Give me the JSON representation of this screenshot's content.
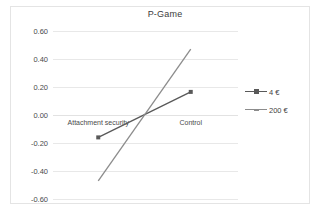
{
  "chart_data": {
    "type": "line",
    "title": "P-Game",
    "xlabel": "",
    "ylabel": "",
    "categories": [
      "Attachment security",
      "Control"
    ],
    "ylim": [
      -0.6,
      0.6
    ],
    "yticks": [
      "0.60",
      "0.40",
      "0.20",
      "0.00",
      "-0.20",
      "-0.40",
      "-0.60"
    ],
    "ytick_values": [
      0.6,
      0.4,
      0.2,
      0.0,
      -0.2,
      -0.4,
      -0.6
    ],
    "grid": true,
    "legend_position": "right",
    "series": [
      {
        "name": "4 €",
        "values": [
          -0.16,
          0.165
        ],
        "color": "#595959",
        "marker": "square"
      },
      {
        "name": "200 €",
        "values": [
          -0.47,
          0.47
        ],
        "color": "#8c8c8c",
        "marker": "none"
      }
    ]
  },
  "legend": {
    "items": [
      {
        "label": "4 €",
        "color": "#595959"
      },
      {
        "label": "200 €",
        "color": "#8c8c8c"
      }
    ]
  },
  "colors": {
    "gridline": "#e8e8e8",
    "text": "#4a4a4a",
    "frame": "#e4e4e4"
  }
}
